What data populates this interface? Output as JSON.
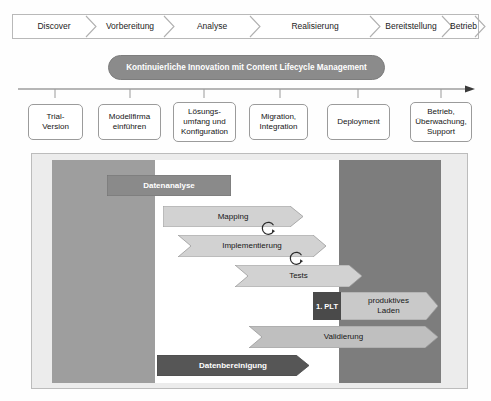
{
  "phases": [
    {
      "label": "Discover",
      "left": 4,
      "width": 74
    },
    {
      "label": "Vorbereitung",
      "left": 78,
      "width": 78
    },
    {
      "label": "Analyse",
      "left": 156,
      "width": 86
    },
    {
      "label": "Realisierung",
      "left": 242,
      "width": 120
    },
    {
      "label": "Bereitstellung",
      "left": 362,
      "width": 72
    },
    {
      "label": "Betrieb",
      "left": 434,
      "width": 33
    }
  ],
  "banner": {
    "text": "Kontinuierliche Innovation mit Content Lifecycle Management"
  },
  "steps": [
    {
      "label": "Trial-\nVersion",
      "left": 28,
      "top": 104,
      "width": 55,
      "height": 36
    },
    {
      "label": "Modellfirma\neinführen",
      "left": 98,
      "top": 104,
      "width": 63,
      "height": 36
    },
    {
      "label": "Lösungs-\numfang und\nKonfiguration",
      "left": 173,
      "top": 102,
      "width": 63,
      "height": 40
    },
    {
      "label": "Migration,\nIntegration",
      "left": 249,
      "top": 104,
      "width": 59,
      "height": 36
    },
    {
      "label": "Deployment",
      "left": 327,
      "top": 104,
      "width": 63,
      "height": 36
    },
    {
      "label": "Betrieb,\nÜberwachung,\nSupport",
      "left": 410,
      "top": 102,
      "width": 62,
      "height": 40
    }
  ],
  "panel_shapes": [
    {
      "name": "datenanalyse",
      "label": "Datenanalyse",
      "kind": "rect",
      "left": 107,
      "top": 175,
      "width": 124,
      "height": 21,
      "fill": "#8a8a8a",
      "stroke": "#6f6f6f",
      "text": "dark"
    },
    {
      "name": "mapping",
      "label": "Mapping",
      "kind": "arrow",
      "left": 163,
      "top": 206,
      "width": 140,
      "height": 21,
      "fill": "#d2d2d2",
      "stroke": "#9a9a9a",
      "text": "light"
    },
    {
      "name": "implementierung",
      "label": "Implementierung",
      "kind": "chevron",
      "left": 178,
      "top": 235,
      "width": 148,
      "height": 22,
      "fill": "#d2d2d2",
      "stroke": "#9a9a9a",
      "text": "light"
    },
    {
      "name": "tests",
      "label": "Tests",
      "kind": "chevron",
      "left": 235,
      "top": 265,
      "width": 127,
      "height": 22,
      "fill": "#d2d2d2",
      "stroke": "#9a9a9a",
      "text": "light"
    },
    {
      "name": "produktives-laden",
      "label": "produktives\nLaden",
      "kind": "arrow",
      "left": 339,
      "top": 292,
      "width": 99,
      "height": 28,
      "fill": "#c9c9c9",
      "stroke": "#9a9a9a",
      "text": "light"
    },
    {
      "name": "validierung",
      "label": "Validierung",
      "kind": "chevron",
      "left": 249,
      "top": 326,
      "width": 189,
      "height": 22,
      "fill": "#bfbfbf",
      "stroke": "#9a9a9a",
      "text": "light"
    },
    {
      "name": "datenbereinigung",
      "label": "Datenbereinigung",
      "kind": "arrow",
      "left": 157,
      "top": 355,
      "width": 152,
      "height": 21,
      "fill": "#565656",
      "stroke": "#464646",
      "text": "dark"
    }
  ],
  "plt": {
    "label": "1. PLT",
    "left": 313,
    "top": 292,
    "width": 28,
    "height": 28
  },
  "loops": [
    {
      "name": "loop-mapping-implementierung",
      "left": 260,
      "top": 219,
      "size": 18
    },
    {
      "name": "loop-implementierung-tests",
      "left": 288,
      "top": 249,
      "size": 18
    }
  ],
  "colors": {
    "banner_fill": "#8b8b8b",
    "band_left": "#9e9e9e",
    "band_right": "#7d7d7d",
    "panel_bg": "#ececec",
    "accent_dark": "#565656"
  }
}
